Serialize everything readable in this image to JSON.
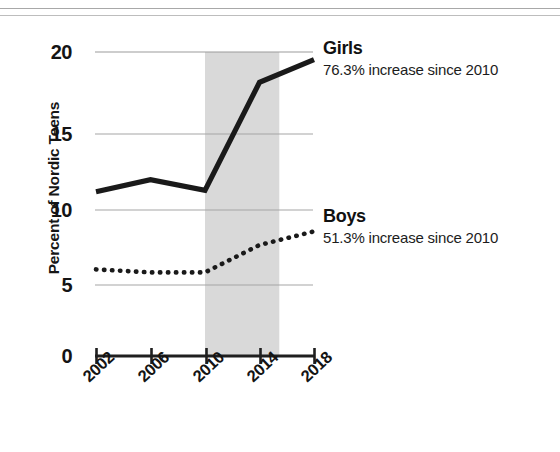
{
  "chart_data": {
    "type": "line",
    "title": "",
    "xlabel": "",
    "ylabel": "Percent of Nordic Teens",
    "categories": [
      "2002",
      "2006",
      "2010",
      "2014",
      "2018"
    ],
    "x": [
      2002,
      2006,
      2010,
      2014,
      2018
    ],
    "xlim": [
      2002,
      2018
    ],
    "ylim": [
      0,
      20
    ],
    "yticks": [
      "20",
      "15",
      "10",
      "5",
      "0"
    ],
    "ytick_values": [
      20,
      15,
      10,
      5,
      0
    ],
    "grid": "horizontal gridlines at 5, 10, 15, 20",
    "legend_position": "inline annotations at right end of each series",
    "series": [
      {
        "name": "Girls",
        "style": "solid",
        "color": "#1a1a1a",
        "values": [
          10.8,
          11.6,
          10.9,
          18.0,
          19.5
        ],
        "annotation_title": "Girls",
        "annotation_sub": "76.3% increase since 2010"
      },
      {
        "name": "Boys",
        "style": "dotted",
        "color": "#1a1a1a",
        "values": [
          5.7,
          5.5,
          5.5,
          7.3,
          8.2
        ],
        "annotation_title": "Boys",
        "annotation_sub": "51.3% increase since 2010"
      }
    ],
    "shaded_region": {
      "label": "",
      "x_start": 2010,
      "x_end": 2015.45,
      "color": "#d9d9d9"
    },
    "colors": {
      "line": "#1a1a1a",
      "gridline": "#9a9a9a",
      "axis": "#1a1a1a",
      "shade": "#d9d9d9",
      "background": "#ffffff"
    }
  },
  "annotations": {
    "girls": {
      "title": "Girls",
      "subtitle": "76.3% increase since 2010"
    },
    "boys": {
      "title": "Boys",
      "subtitle": "51.3% increase since 2010"
    }
  },
  "axes": {
    "y_label": "Percent of Nordic Teens",
    "y_ticks": [
      "20",
      "15",
      "10",
      "5",
      "0"
    ],
    "x_ticks": [
      "2002",
      "2006",
      "2010",
      "2014",
      "2018"
    ]
  }
}
